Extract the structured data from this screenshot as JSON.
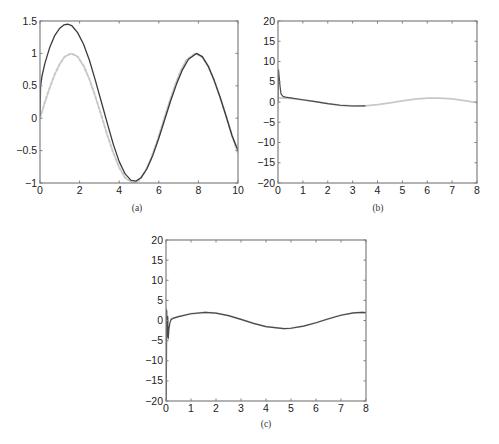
{
  "figure": {
    "background": "#ffffff",
    "axis_color": "#808080",
    "tick_label_color": "#222222"
  },
  "chart_data": [
    {
      "id": "a",
      "type": "line",
      "caption": "(a)",
      "title": "",
      "xlabel": "",
      "ylabel": "",
      "xlim": [
        0,
        10
      ],
      "ylim": [
        -1,
        1.5
      ],
      "xticks": [
        0,
        2,
        4,
        6,
        8,
        10
      ],
      "xtick_labels": [
        "0",
        "2",
        "4",
        "6",
        "8",
        "10"
      ],
      "yticks": [
        -1,
        -0.5,
        0,
        0.5,
        1,
        1.5
      ],
      "ytick_labels": [
        "−1",
        "−0.5",
        "0",
        "0.5",
        "1",
        "1.5"
      ],
      "grid": false,
      "legend": null,
      "frame": {
        "left": 40,
        "top": 21,
        "right": 238,
        "bottom": 183
      },
      "caption_pos": {
        "x": 137,
        "y": 203
      },
      "series": [
        {
          "name": "reference (dashed, light)",
          "color": "#c8c8c8",
          "dash": "3,2",
          "width": 2,
          "x": [
            0,
            0.25,
            0.5,
            0.75,
            1.0,
            1.25,
            1.57,
            1.9,
            2.2,
            2.5,
            2.8,
            3.1,
            3.4,
            3.7,
            4.0,
            4.3,
            4.71,
            5.0,
            5.3,
            5.6,
            5.9,
            6.2,
            6.5,
            6.8,
            7.1,
            7.4,
            7.85,
            8.2,
            8.5,
            8.8,
            9.1,
            9.4,
            9.7,
            10
          ],
          "y": [
            0,
            0.25,
            0.48,
            0.68,
            0.84,
            0.95,
            1.0,
            0.95,
            0.81,
            0.6,
            0.33,
            0.04,
            -0.26,
            -0.53,
            -0.76,
            -0.92,
            -1.0,
            -0.96,
            -0.83,
            -0.63,
            -0.37,
            -0.08,
            0.22,
            0.49,
            0.73,
            0.9,
            1.0,
            0.94,
            0.8,
            0.58,
            0.32,
            0.03,
            -0.27,
            -0.54
          ]
        },
        {
          "name": "estimate (solid, dark)",
          "color": "#3a3a3a",
          "dash": "",
          "width": 1.3,
          "x": [
            0,
            0.03,
            0.1,
            0.25,
            0.5,
            0.75,
            1.0,
            1.2,
            1.4,
            1.6,
            1.9,
            2.2,
            2.5,
            2.8,
            3.1,
            3.4,
            3.7,
            4.0,
            4.3,
            4.6,
            4.85,
            5.1,
            5.4,
            5.7,
            6.0,
            6.3,
            6.6,
            6.9,
            7.2,
            7.5,
            7.9,
            8.2,
            8.5,
            8.8,
            9.1,
            9.4,
            9.7,
            10
          ],
          "y": [
            0.05,
            0.5,
            0.65,
            0.85,
            1.1,
            1.28,
            1.39,
            1.44,
            1.45,
            1.43,
            1.32,
            1.14,
            0.89,
            0.58,
            0.25,
            -0.08,
            -0.4,
            -0.67,
            -0.86,
            -0.96,
            -0.97,
            -0.92,
            -0.78,
            -0.57,
            -0.31,
            -0.02,
            0.27,
            0.53,
            0.75,
            0.91,
            1.0,
            0.95,
            0.8,
            0.58,
            0.32,
            0.03,
            -0.27,
            -0.5
          ]
        }
      ]
    },
    {
      "id": "b",
      "type": "line",
      "caption": "(b)",
      "title": "",
      "xlabel": "",
      "ylabel": "",
      "xlim": [
        0,
        8
      ],
      "ylim": [
        -20,
        20
      ],
      "xticks": [
        0,
        1,
        2,
        3,
        4,
        5,
        6,
        7,
        8
      ],
      "xtick_labels": [
        "0",
        "1",
        "2",
        "3",
        "4",
        "5",
        "6",
        "7",
        "8"
      ],
      "yticks": [
        -20,
        -15,
        -10,
        -5,
        0,
        5,
        10,
        15,
        20
      ],
      "ytick_labels": [
        "−20",
        "−15",
        "−10",
        "−5",
        "0",
        "5",
        "10",
        "15",
        "20"
      ],
      "grid": false,
      "legend": null,
      "frame": {
        "left": 278,
        "top": 21,
        "right": 477,
        "bottom": 183
      },
      "caption_pos": {
        "x": 378,
        "y": 203
      },
      "series": [
        {
          "name": "reference (light)",
          "color": "#c8c8c8",
          "dash": "",
          "width": 1.8,
          "x": [
            0,
            0.5,
            1.0,
            1.5,
            2.0,
            2.5,
            3.0,
            3.5,
            4.0,
            4.5,
            5.0,
            5.5,
            6.0,
            6.5,
            7.0,
            7.5,
            8.0
          ],
          "y": [
            1.0,
            0.88,
            0.54,
            0.07,
            -0.42,
            -0.8,
            -0.99,
            -0.94,
            -0.65,
            -0.21,
            0.28,
            0.71,
            0.96,
            0.98,
            0.75,
            0.35,
            -0.15
          ]
        },
        {
          "name": "estimate (dark)",
          "color": "#4a4a4a",
          "dash": "",
          "width": 1.2,
          "x": [
            0,
            0.02,
            0.05,
            0.08,
            0.12,
            0.2,
            0.3,
            0.5,
            1.0,
            1.5,
            2.0,
            2.5,
            3.0,
            3.5
          ],
          "y": [
            0,
            8,
            6,
            4,
            2,
            1.4,
            1.2,
            1.0,
            0.55,
            0.08,
            -0.42,
            -0.8,
            -0.99,
            -0.94
          ]
        }
      ]
    },
    {
      "id": "c",
      "type": "line",
      "caption": "(c)",
      "title": "",
      "xlabel": "",
      "ylabel": "",
      "xlim": [
        0,
        8
      ],
      "ylim": [
        -20,
        20
      ],
      "xticks": [
        0,
        1,
        2,
        3,
        4,
        5,
        6,
        7,
        8
      ],
      "xtick_labels": [
        "0",
        "1",
        "2",
        "3",
        "4",
        "5",
        "6",
        "7",
        "8"
      ],
      "yticks": [
        -20,
        -15,
        -10,
        -5,
        0,
        5,
        10,
        15,
        20
      ],
      "ytick_labels": [
        "−20",
        "−15",
        "−10",
        "−5",
        "0",
        "5",
        "10",
        "15",
        "20"
      ],
      "grid": false,
      "legend": null,
      "frame": {
        "left": 166,
        "top": 240,
        "right": 366,
        "bottom": 401
      },
      "caption_pos": {
        "x": 266,
        "y": 419
      },
      "series": [
        {
          "name": "reference (light)",
          "color": "#c8c8c8",
          "dash": "",
          "width": 1.8,
          "x": [
            0.2,
            0.5,
            1.0,
            1.57,
            2.0,
            2.5,
            3.0,
            3.5,
            4.0,
            4.71,
            5.0,
            5.5,
            6.0,
            6.5,
            7.0,
            7.5,
            7.85,
            8.0
          ],
          "y": [
            0.4,
            0.96,
            1.68,
            2.0,
            1.82,
            1.2,
            0.28,
            -0.7,
            -1.51,
            -2.0,
            -1.92,
            -1.41,
            -0.56,
            0.43,
            1.31,
            1.88,
            2.0,
            1.98
          ]
        },
        {
          "name": "estimate (dark)",
          "color": "#4a4a4a",
          "dash": "",
          "width": 1.2,
          "x": [
            0,
            0.01,
            0.03,
            0.05,
            0.07,
            0.09,
            0.12,
            0.16,
            0.2,
            0.3,
            0.5,
            1.0,
            1.57,
            2.0,
            2.5,
            3.0,
            3.5,
            4.0,
            4.71,
            5.0,
            5.5,
            6.0,
            6.5,
            7.0,
            7.5,
            7.85,
            8.0
          ],
          "y": [
            3,
            -20,
            2.5,
            -4,
            1,
            -4.5,
            -2,
            -0.5,
            0.2,
            0.6,
            0.96,
            1.68,
            2.0,
            1.82,
            1.2,
            0.28,
            -0.7,
            -1.51,
            -2.0,
            -1.92,
            -1.41,
            -0.56,
            0.43,
            1.31,
            1.88,
            2.0,
            1.98
          ]
        }
      ]
    }
  ]
}
